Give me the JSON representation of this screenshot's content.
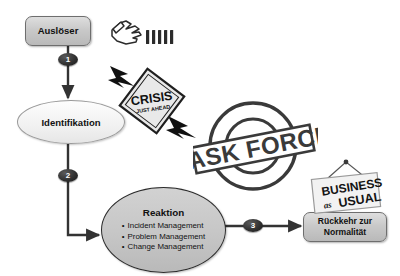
{
  "diagram": {
    "background_color": "#ffffff",
    "nodes": {
      "trigger": {
        "label": "Auslöser",
        "shape": "rounded-rectangle",
        "fill": "#cccccc",
        "border": "#6e6e6e"
      },
      "identification": {
        "label": "Identifikation",
        "shape": "ellipse",
        "fill": "#f4f4f4",
        "border": "#9a9a9a"
      },
      "reaction": {
        "title": "Reaktion",
        "shape": "ellipse",
        "fill": "#c6c6c6",
        "border": "#2b2b2b",
        "items": [
          "Incident Management",
          "Problem Management",
          "Change Management"
        ]
      },
      "return_to_normal": {
        "label_line1": "Rückkehr zur",
        "label_line2": "Normalität",
        "shape": "rounded-rectangle",
        "fill": "#cccccc",
        "border": "#6e6e6e"
      }
    },
    "steps": [
      {
        "number": "1",
        "from": "trigger",
        "to": "identification"
      },
      {
        "number": "2",
        "from": "identification",
        "to": "reaction"
      },
      {
        "number": "3",
        "from": "reaction",
        "to": "return_to_normal"
      }
    ],
    "decorations": {
      "hand": {
        "icon": "pointing-hand-icon",
        "description": "hand pushing dominoes",
        "domino_count": 5
      },
      "crisis_sign": {
        "icon": "crisis-warning-sign-icon",
        "line1": "CRISIS",
        "line2": "JUST AHEAD",
        "shape": "diamond",
        "fill": "#e8e8e8",
        "text_color": "#1a1a1a"
      },
      "task_force_stamp": {
        "icon": "task-force-stamp-icon",
        "label": "TASK FORCE",
        "shape": "circular-stamp",
        "color": "#3a3a3a"
      },
      "business_sign": {
        "icon": "hanging-sign-icon",
        "line1": "BUSINESS",
        "line2_small": "as",
        "line2": "USUAL",
        "fill": "#f0f0f0",
        "text_color": "#1a1a1a"
      }
    },
    "connector_color": "#333333"
  }
}
